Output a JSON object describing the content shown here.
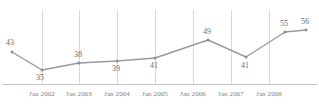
{
  "chart_data": {
    "type": "line",
    "title": "",
    "subtitle": "",
    "xlabel": "",
    "ylabel": "",
    "grid": true,
    "legend": false,
    "legend_position": "none",
    "xlim": [
      0,
      8
    ],
    "ylim": [
      30,
      60
    ],
    "x": [
      "Jul 2001",
      "Jan 2002",
      "Jan 2003",
      "Jan 2004",
      "Jan 2005",
      "Jan 2006",
      "Jan 2007",
      "Jan 2008",
      "Jul 2008"
    ],
    "tick_labels": [
      "Jan 2002",
      "Jan 2003",
      "Jan 2004",
      "Jan 2005",
      "Jan 2006",
      "Jan 2007",
      "Jan 2008"
    ],
    "values": [
      43,
      35,
      38,
      39,
      41,
      49,
      41,
      55,
      56
    ],
    "point_labels": [
      "43",
      "35",
      "38",
      "39",
      "41",
      "49",
      "41",
      "55",
      "56"
    ],
    "series": [
      {
        "name": "",
        "values": [
          43,
          35,
          38,
          39,
          41,
          49,
          41,
          55,
          56
        ],
        "color": "#9a9a9a"
      }
    ],
    "colors": {
      "line": "#9a9a9a",
      "marker": "#8e8e8e",
      "gridline": "#d8d8d8",
      "axis": "#c6c6c6",
      "label_text": "#6b6b6b",
      "tick_text": "#808080",
      "background": "#ffffff"
    }
  },
  "geometry": {
    "point_px": [
      {
        "x": 12,
        "y": 52,
        "label_x": 6,
        "label_y": 39
      },
      {
        "x": 42,
        "y": 70,
        "label_x": 36,
        "label_y": 74
      },
      {
        "x": 79,
        "y": 63,
        "label_x": 74,
        "label_y": 51
      },
      {
        "x": 117,
        "y": 61,
        "label_x": 112,
        "label_y": 65
      },
      {
        "x": 155,
        "y": 58,
        "label_x": 150,
        "label_y": 62
      },
      {
        "x": 208,
        "y": 40,
        "label_x": 203,
        "label_y": 28
      },
      {
        "x": 246,
        "y": 57,
        "label_x": 241,
        "label_y": 62
      },
      {
        "x": 285,
        "y": 32,
        "label_x": 280,
        "label_y": 20
      },
      {
        "x": 306,
        "y": 30,
        "label_x": 301,
        "label_y": 18
      }
    ],
    "gridline_x": [
      42,
      79,
      117,
      155,
      193,
      231,
      269
    ],
    "gridline_top": 10,
    "gridline_bottom": 84,
    "axis_y": 84,
    "axis_x0": 2,
    "axis_x1": 317,
    "tick_label_y": 91
  }
}
